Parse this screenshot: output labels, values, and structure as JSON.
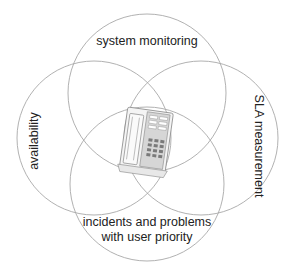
{
  "diagram": {
    "type": "venn",
    "title": "",
    "center_icon": "telephone-icon",
    "circles": [
      {
        "id": "top",
        "label": "system monitoring"
      },
      {
        "id": "left",
        "label": "availability"
      },
      {
        "id": "right",
        "label": "SLA measurement"
      },
      {
        "id": "bottom",
        "label_line1": "incidents and problems",
        "label_line2": "with user priority"
      }
    ],
    "colors": {
      "circle_stroke": "#a8a8a8",
      "text": "#222222",
      "phone_body": "#f2f2f2",
      "phone_keypad": "#b5b5b5"
    }
  }
}
